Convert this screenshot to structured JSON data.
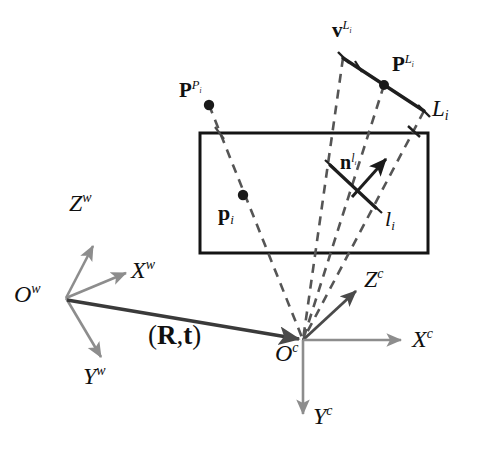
{
  "figure": {
    "background": "#ffffff",
    "ink_color": "#1a1a1a",
    "gray_color": "#8d8d8d",
    "dash_color": "#555555",
    "width": 483,
    "height": 455
  },
  "labels": {
    "world_origin": {
      "base": "O",
      "sup": "w"
    },
    "world_x": {
      "base": "X",
      "sup": "w"
    },
    "world_y": {
      "base": "Y",
      "sup": "w"
    },
    "world_z": {
      "base": "Z",
      "sup": "w"
    },
    "camera_origin": {
      "base": "O",
      "sup": "c"
    },
    "camera_x": {
      "base": "X",
      "sup": "c"
    },
    "camera_y": {
      "base": "Y",
      "sup": "c"
    },
    "camera_z": {
      "base": "Z",
      "sup": "c"
    },
    "transform": {
      "open": "(",
      "r": "R",
      "comma": ",",
      "t": "t",
      "close": ")"
    },
    "point_3d": {
      "base": "P",
      "sup": "P",
      "subsup": "i"
    },
    "point_2d": {
      "base": "p",
      "sub": "i"
    },
    "line_3d": {
      "base": "L",
      "sub": "i"
    },
    "line_2d": {
      "base": "l",
      "sub": "i"
    },
    "line_direction": {
      "base": "v",
      "sup": "L",
      "subsup": "i"
    },
    "line_point": {
      "base": "P",
      "sup": "L",
      "subsup": "i"
    },
    "line_normal": {
      "base": "n",
      "sup": "l",
      "subsup": "i"
    }
  },
  "geometry": {
    "image_plane_rect": {
      "x": 200,
      "y": 133,
      "w": 228,
      "h": 120
    },
    "world_frame": {
      "origin": [
        65,
        298
      ],
      "axes": [
        {
          "name": "Z",
          "tip": [
            93,
            244
          ]
        },
        {
          "name": "X",
          "tip": [
            126,
            272
          ]
        },
        {
          "name": "Y",
          "tip": [
            101,
            358
          ]
        }
      ]
    },
    "camera_frame": {
      "origin": [
        303,
        340
      ],
      "axes": [
        {
          "name": "Z",
          "tip": [
            355,
            292
          ]
        },
        {
          "name": "X",
          "tip": [
            400,
            340
          ]
        },
        {
          "name": "Y",
          "tip": [
            303,
            414
          ]
        }
      ]
    },
    "extrinsic_arrow": {
      "from": [
        68,
        300
      ],
      "to": [
        300,
        340
      ]
    },
    "line_3d_segment": {
      "from": [
        343,
        58
      ],
      "to": [
        424,
        111
      ]
    },
    "point_3d_dot": [
      209,
      105
    ],
    "point_2d_dot": [
      243,
      195
    ],
    "line_point_dot": [
      384,
      85
    ],
    "line_2d_segment": {
      "from": [
        330,
        165
      ],
      "to": [
        375,
        207
      ]
    },
    "normal_arrow": {
      "from": [
        352,
        196
      ],
      "to": [
        387,
        158
      ]
    },
    "projection_rays": [
      {
        "from": [
          209,
          105
        ],
        "to": [
          303,
          340
        ]
      },
      {
        "from": [
          343,
          58
        ],
        "to": [
          303,
          340
        ]
      },
      {
        "from": [
          384,
          85
        ],
        "to": [
          303,
          340
        ]
      },
      {
        "from": [
          424,
          111
        ],
        "to": [
          303,
          340
        ]
      }
    ]
  }
}
